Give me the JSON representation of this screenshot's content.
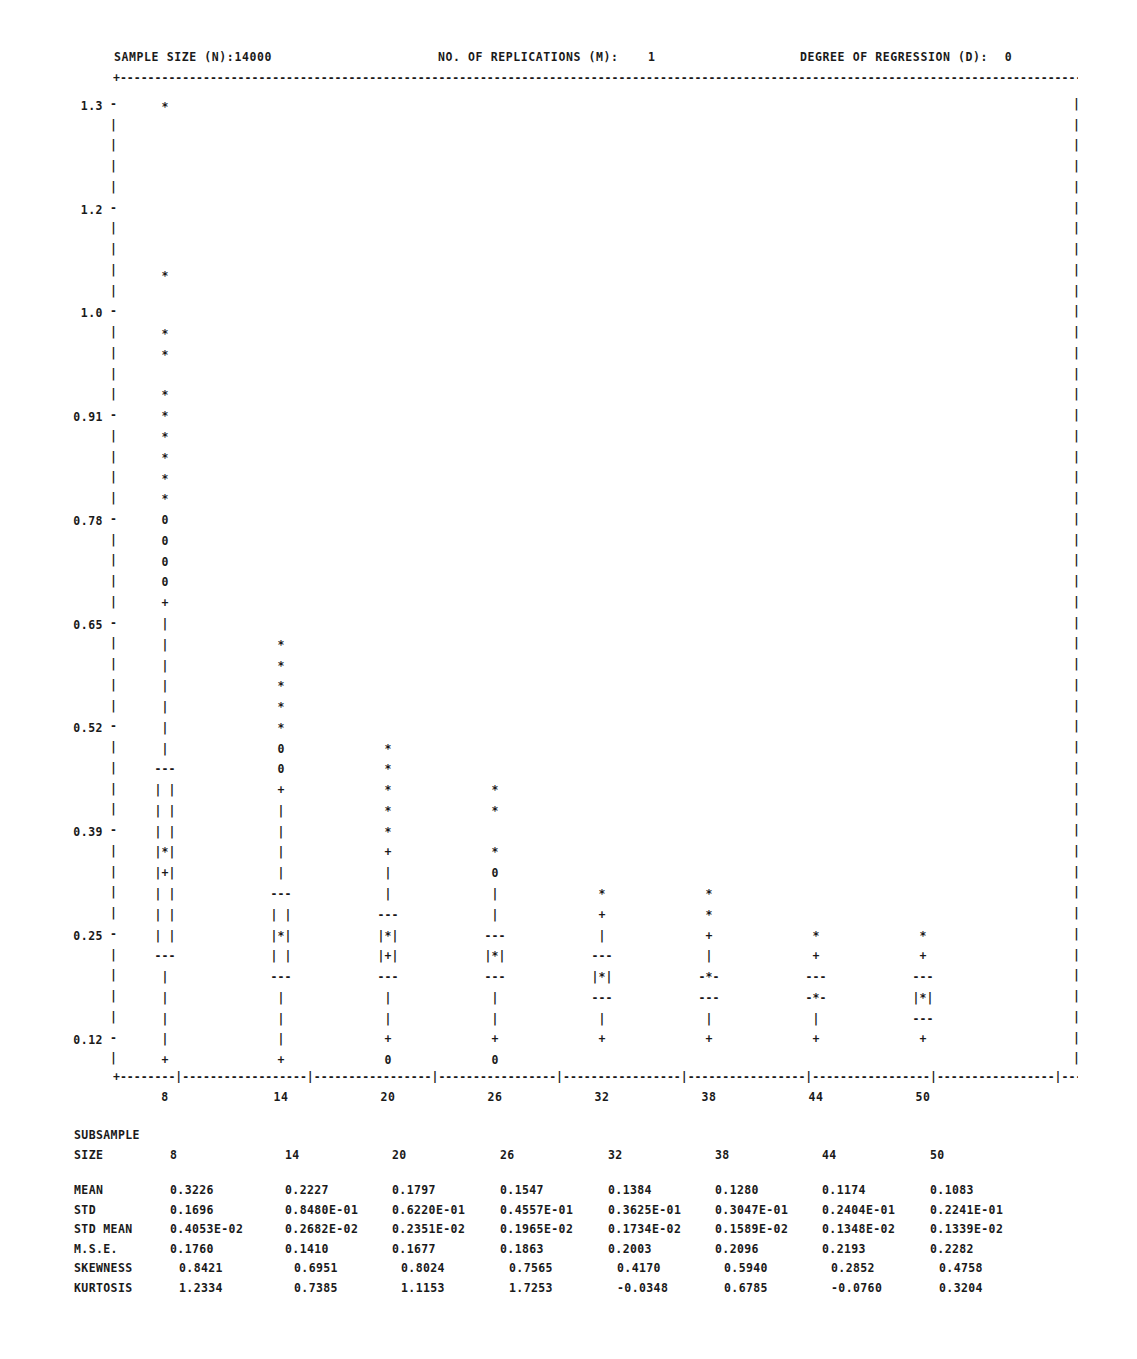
{
  "header": {
    "sample_size_label": "SAMPLE SIZE (N):14000",
    "replications_label": "NO. OF REPLICATIONS (M):",
    "replications_value": "1",
    "degree_label": "DEGREE OF REGRESSION (D):",
    "degree_value": "0"
  },
  "axes": {
    "y_ticks": [
      "1.3",
      "1.2",
      "1.0",
      "0.91",
      "0.78",
      "0.65",
      "0.52",
      "0.39",
      "0.25",
      "0.12"
    ],
    "x_ticks": [
      "8",
      "14",
      "20",
      "26",
      "32",
      "38",
      "44",
      "50"
    ],
    "y_label": "",
    "x_label": ""
  },
  "stats": {
    "subsample_label": "SUBSAMPLE",
    "size_label": "SIZE",
    "row_labels": [
      "MEAN",
      "STD",
      "STD MEAN",
      "M.S.E.",
      "SKEWNESS",
      "KURTOSIS"
    ],
    "sizes": [
      "8",
      "14",
      "20",
      "26",
      "32",
      "38",
      "44",
      "50"
    ],
    "rows": [
      {
        "label": "MEAN",
        "values": [
          "0.3226",
          "0.2227",
          "0.1797",
          "0.1547",
          "0.1384",
          "0.1280",
          "0.1174",
          "0.1083"
        ]
      },
      {
        "label": "STD",
        "values": [
          "0.1696",
          "0.8480E-01",
          "0.6220E-01",
          "0.4557E-01",
          "0.3625E-01",
          "0.3047E-01",
          "0.2404E-01",
          "0.2241E-01"
        ]
      },
      {
        "label": "STD MEAN",
        "values": [
          "0.4053E-02",
          "0.2682E-02",
          "0.2351E-02",
          "0.1965E-02",
          "0.1734E-02",
          "0.1589E-02",
          "0.1348E-02",
          "0.1339E-02"
        ]
      },
      {
        "label": "M.S.E.",
        "values": [
          "0.1760",
          "0.1410",
          "0.1677",
          "0.1863",
          "0.2003",
          "0.2096",
          "0.2193",
          "0.2282"
        ]
      },
      {
        "label": "SKEWNESS",
        "values": [
          "0.8421",
          "0.6951",
          "0.8024",
          "0.7565",
          "0.4170",
          "0.5940",
          "0.2852",
          "0.4758"
        ]
      },
      {
        "label": "KURTOSIS",
        "values": [
          "1.2334",
          "0.7385",
          "1.1153",
          "1.7253",
          "-0.0348",
          "0.6785",
          "-0.0760",
          "0.3204"
        ]
      }
    ]
  },
  "chart_data": {
    "type": "box",
    "title": "",
    "xlabel": "SUBSAMPLE SIZE",
    "ylabel": "",
    "grid": false,
    "legend": "none",
    "ylim": [
      0.05,
      1.35
    ],
    "y_tick_values": [
      1.3,
      1.2,
      1.0,
      0.91,
      0.78,
      0.65,
      0.52,
      0.39,
      0.25,
      0.12
    ],
    "categories": [
      "8",
      "14",
      "20",
      "26",
      "32",
      "38",
      "44",
      "50"
    ],
    "symbols": {
      "asterisk": "* = extreme outlier",
      "o": "0 = outlier",
      "plus": "+ = whisker end / mean",
      "pipe": "| = whisker",
      "dashes": "--- = quartile hinge",
      "box_star": "|*| = median inside box"
    },
    "series": [
      {
        "name": "8",
        "median": 0.3226,
        "q1": 0.27,
        "q3": 0.39,
        "whisker_low": 0.12,
        "whisker_high": 0.65,
        "outliers": [
          0.7,
          0.72,
          0.74,
          0.76
        ],
        "extremes": [
          1.29,
          1.05,
          0.96,
          0.93,
          0.91,
          0.89,
          0.86,
          0.84,
          0.81,
          0.78
        ]
      },
      {
        "name": "14",
        "median": 0.2227,
        "q1": 0.19,
        "q3": 0.26,
        "whisker_low": 0.1,
        "whisker_high": 0.39,
        "outliers": [
          0.42,
          0.4
        ],
        "extremes": [
          0.57,
          0.545,
          0.52,
          0.495,
          0.47,
          0.445
        ]
      },
      {
        "name": "20",
        "median": 0.1797,
        "q1": 0.16,
        "q3": 0.21,
        "whisker_low": 0.095,
        "whisker_high": 0.27,
        "outliers": [
          0.085
        ],
        "extremes": [
          0.42,
          0.395,
          0.37,
          0.345,
          0.32
        ]
      },
      {
        "name": "26",
        "median": 0.1547,
        "q1": 0.135,
        "q3": 0.18,
        "whisker_low": 0.095,
        "whisker_high": 0.24,
        "outliers": [
          0.25,
          0.085
        ],
        "extremes": [
          0.365,
          0.34,
          0.29
        ]
      },
      {
        "name": "32",
        "median": 0.1384,
        "q1": 0.125,
        "q3": 0.155,
        "whisker_low": 0.095,
        "whisker_high": 0.19,
        "outliers": [],
        "extremes": [
          0.24,
          0.215
        ]
      },
      {
        "name": "38",
        "median": 0.128,
        "q1": 0.115,
        "q3": 0.14,
        "whisker_low": 0.095,
        "whisker_high": 0.18,
        "outliers": [],
        "extremes": [
          0.24,
          0.215
        ]
      },
      {
        "name": "44",
        "median": 0.1174,
        "q1": 0.11,
        "q3": 0.132,
        "whisker_low": 0.095,
        "whisker_high": 0.165,
        "outliers": [],
        "extremes": [
          0.19
        ]
      },
      {
        "name": "50",
        "median": 0.1083,
        "q1": 0.102,
        "q3": 0.125,
        "whisker_low": 0.095,
        "whisker_high": 0.16,
        "outliers": [],
        "extremes": [
          0.19
        ]
      }
    ]
  },
  "plot_rows": {
    "col8": [
      [
        108,
        "*"
      ],
      [
        277,
        "*"
      ],
      [
        335,
        "*"
      ],
      [
        356,
        "*"
      ],
      [
        396,
        "*"
      ],
      [
        417,
        "*"
      ],
      [
        438,
        "*"
      ],
      [
        459,
        "*"
      ],
      [
        480,
        "*"
      ],
      [
        500,
        "*"
      ],
      [
        521,
        "0"
      ],
      [
        542,
        "0"
      ],
      [
        563,
        "0"
      ],
      [
        583,
        "0"
      ],
      [
        604,
        "+"
      ],
      [
        625,
        "|"
      ],
      [
        646,
        "|"
      ],
      [
        667,
        "|"
      ],
      [
        687,
        "|"
      ],
      [
        708,
        "|"
      ],
      [
        729,
        "|"
      ],
      [
        750,
        "|"
      ],
      [
        770,
        "---"
      ],
      [
        791,
        "| |"
      ],
      [
        812,
        "| |"
      ],
      [
        833,
        "| |"
      ],
      [
        853,
        "|*|"
      ],
      [
        874,
        "|+|"
      ],
      [
        895,
        "| |"
      ],
      [
        916,
        "| |"
      ],
      [
        937,
        "| |"
      ],
      [
        957,
        "---"
      ],
      [
        978,
        "|"
      ],
      [
        999,
        "|"
      ],
      [
        1020,
        "|"
      ],
      [
        1040,
        "|"
      ],
      [
        1061,
        "+"
      ]
    ],
    "col14": [
      [
        646,
        "*"
      ],
      [
        667,
        "*"
      ],
      [
        687,
        "*"
      ],
      [
        708,
        "*"
      ],
      [
        729,
        "*"
      ],
      [
        750,
        "0"
      ],
      [
        770,
        "0"
      ],
      [
        791,
        "+"
      ],
      [
        812,
        "|"
      ],
      [
        833,
        "|"
      ],
      [
        853,
        "|"
      ],
      [
        874,
        "|"
      ],
      [
        895,
        "---"
      ],
      [
        916,
        "| |"
      ],
      [
        937,
        "|*|"
      ],
      [
        957,
        "| |"
      ],
      [
        978,
        "---"
      ],
      [
        999,
        "|"
      ],
      [
        1020,
        "|"
      ],
      [
        1040,
        "|"
      ],
      [
        1061,
        "+"
      ]
    ],
    "col20": [
      [
        750,
        "*"
      ],
      [
        770,
        "*"
      ],
      [
        791,
        "*"
      ],
      [
        812,
        "*"
      ],
      [
        833,
        "*"
      ],
      [
        853,
        "+"
      ],
      [
        874,
        "|"
      ],
      [
        895,
        "|"
      ],
      [
        916,
        "---"
      ],
      [
        937,
        "|*|"
      ],
      [
        957,
        "|+|"
      ],
      [
        978,
        "---"
      ],
      [
        999,
        "|"
      ],
      [
        1020,
        "|"
      ],
      [
        1040,
        "+"
      ],
      [
        1061,
        "0"
      ]
    ],
    "col26": [
      [
        791,
        "*"
      ],
      [
        812,
        "*"
      ],
      [
        853,
        "*"
      ],
      [
        874,
        "0"
      ],
      [
        895,
        "|"
      ],
      [
        916,
        "|"
      ],
      [
        937,
        "---"
      ],
      [
        957,
        "|*|"
      ],
      [
        978,
        "---"
      ],
      [
        999,
        "|"
      ],
      [
        1020,
        "|"
      ],
      [
        1040,
        "+"
      ],
      [
        1061,
        "0"
      ]
    ],
    "col32": [
      [
        895,
        "*"
      ],
      [
        916,
        "+"
      ],
      [
        937,
        "|"
      ],
      [
        957,
        "---"
      ],
      [
        978,
        "|*|"
      ],
      [
        999,
        "---"
      ],
      [
        1020,
        "|"
      ],
      [
        1040,
        "+"
      ]
    ],
    "col38": [
      [
        895,
        "*"
      ],
      [
        916,
        "*"
      ],
      [
        937,
        "+"
      ],
      [
        957,
        "|"
      ],
      [
        978,
        "-*-"
      ],
      [
        999,
        "---"
      ],
      [
        1020,
        "|"
      ],
      [
        1040,
        "+"
      ]
    ],
    "col44": [
      [
        937,
        "*"
      ],
      [
        957,
        "+"
      ],
      [
        978,
        "---"
      ],
      [
        999,
        "-*-"
      ],
      [
        1020,
        "|"
      ],
      [
        1040,
        "+"
      ]
    ],
    "col50": [
      [
        937,
        "*"
      ],
      [
        957,
        "+"
      ],
      [
        978,
        "---"
      ],
      [
        999,
        "|*|"
      ],
      [
        1020,
        "---"
      ],
      [
        1040,
        "+"
      ]
    ]
  }
}
